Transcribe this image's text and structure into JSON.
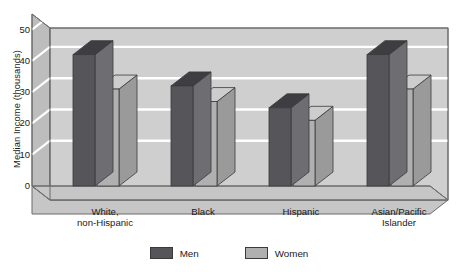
{
  "chart_data": {
    "type": "bar",
    "title": "",
    "xlabel": "",
    "ylabel": "Median Income (thousands)",
    "ylim": [
      0,
      55
    ],
    "yticks": [
      0,
      10,
      20,
      30,
      40,
      50
    ],
    "grid": true,
    "legend_position": "bottom-center",
    "style": "3d-grouped-bar",
    "categories": [
      "White,\nnon-Hispanic",
      "Black",
      "Hispanic",
      "Asian/Pacific\nIslander"
    ],
    "series": [
      {
        "name": "Men",
        "color": "#56565a",
        "values": [
          42,
          32,
          25,
          42
        ]
      },
      {
        "name": "Women",
        "color": "#b0b0b0",
        "values": [
          31,
          27,
          21,
          31
        ]
      }
    ]
  },
  "legend": {
    "items": [
      {
        "label": "Men",
        "color": "#56565a"
      },
      {
        "label": "Women",
        "color": "#b0b0b0"
      }
    ]
  },
  "axes": {
    "y_title": "Median Income (thousands)",
    "y_tick_labels": [
      "50",
      "40",
      "30",
      "20",
      "10",
      "0"
    ]
  },
  "colors": {
    "plot_background": "#cfcfcf",
    "wall_side": "#bdbdbd",
    "floor": "#c6c6c6",
    "gridline": "#ffffff",
    "frame": "#6b6b6b",
    "men_front": "#56565a",
    "men_top": "#3e3e42",
    "men_side": "#6e6e72",
    "women_front": "#b0b0b0",
    "women_top": "#cdcdcd",
    "women_side": "#9a9a9a"
  }
}
